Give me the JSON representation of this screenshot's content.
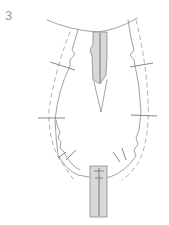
{
  "figure": {
    "step_label": "3",
    "colors": {
      "outline": "#8a8a8a",
      "seam_allowance": "#9a9a9a",
      "zipper_fill": "#d8d8d8",
      "background": "#ffffff"
    },
    "elements": [
      {
        "name": "top-placket",
        "type": "filled-strip"
      },
      {
        "name": "dart",
        "type": "triangle"
      },
      {
        "name": "bottom-zipper",
        "type": "filled-strip"
      },
      {
        "name": "notch-marks",
        "count": 6
      }
    ]
  }
}
